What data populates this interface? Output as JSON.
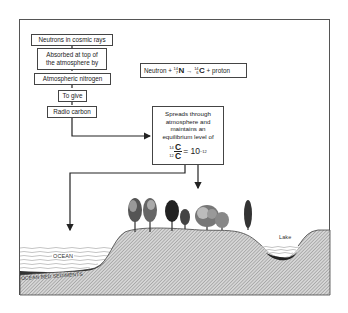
{
  "diagram": {
    "flow_steps": [
      {
        "id": "step1",
        "label": "Neutrons in cosmic rays"
      },
      {
        "id": "step2",
        "label_lines": [
          "Absorbed at top of",
          "the atmosphere by"
        ]
      },
      {
        "id": "step3",
        "label": "Atmospheric nitrogen"
      },
      {
        "id": "step4",
        "label": "To give"
      },
      {
        "id": "step5",
        "label": "Radio carbon"
      }
    ],
    "equation": {
      "reactant1": "Neutron",
      "plus1": "+",
      "n_mass": "14",
      "n_atomic": "7",
      "n_symbol": "N",
      "arrow": "→",
      "c_mass": "14",
      "c_atomic": "6",
      "c_symbol": "C",
      "plus2": "+",
      "product2": "proton"
    },
    "equilibrium_box": {
      "lines": [
        "Spreads through",
        "atmosphere and",
        "maintains an",
        "equilibrium level of"
      ],
      "ratio_top_mass": "14",
      "ratio_top": "C",
      "ratio_bottom_mass": "12",
      "ratio_bottom": "C",
      "equals": "= 10",
      "exponent": "−12"
    },
    "landscape_labels": {
      "ocean": "OCEAN",
      "sediments": "OCEAN BED SEDIMENTS",
      "lake": "Lake"
    },
    "colors": {
      "line": "#222222",
      "ground_hatch": "#9a9a9a",
      "ground_bg": "#d0d0d0",
      "sediment": "#333333",
      "water_line": "#888888"
    }
  }
}
